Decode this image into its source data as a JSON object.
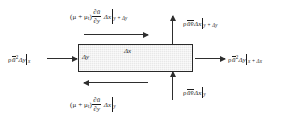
{
  "figure": {
    "colors": {
      "stroke": "#2e2e2e",
      "box_border": "#2a2a2a",
      "box_fill": "#e8e8e8",
      "text": "#1c1c1c",
      "background": "#ffffff"
    }
  },
  "control_volume": {
    "width_label": "Δx",
    "height_label": "Δy"
  },
  "fluxes": {
    "top_shear": {
      "name": "top-face-turbulent-shear-force",
      "prefactor": "(μ + μ",
      "prefactor_sub": "t",
      "prefactor_close": ")",
      "derivative_numerator": "∂ū",
      "derivative_denominator": "∂y",
      "length": "Δx",
      "evaluated_at": "y + Δy",
      "direction": "right",
      "plain": "(μ+μ_t) ∂ū/∂y Δx |_(y+Δy)"
    },
    "bottom_shear": {
      "name": "bottom-face-turbulent-shear-force",
      "prefactor": "(μ + μ",
      "prefactor_sub": "t",
      "prefactor_close": ")",
      "derivative_numerator": "∂ū",
      "derivative_denominator": "∂y",
      "length": "Δx",
      "evaluated_at": "y",
      "direction": "left",
      "plain": "(μ+μ_t) ∂ū/∂y Δx |_y"
    },
    "left_inflow": {
      "name": "left-face-x-momentum-influx",
      "density": "ρ",
      "velocity": "ū",
      "exponent": "2",
      "area": "Δy",
      "evaluated_at": "x",
      "direction": "right",
      "plain": "ρū²Δy |_x"
    },
    "right_outflow": {
      "name": "right-face-x-momentum-outflux",
      "density": "ρ",
      "velocity": "ū",
      "exponent": "2",
      "area": "Δy",
      "evaluated_at": "x + Δx",
      "direction": "right",
      "plain": "ρū²Δy |_(x+Δx)"
    },
    "top_reynolds": {
      "name": "top-face-reynolds-momentum-flux",
      "density": "ρ",
      "velocity": "ūv̄",
      "area": "Δx",
      "evaluated_at": "y + Δy",
      "direction": "up",
      "plain": "ρūv̄Δx |_(y+Δy)"
    },
    "bottom_reynolds": {
      "name": "bottom-face-reynolds-momentum-flux",
      "density": "ρ",
      "velocity": "ūv̄",
      "area": "Δx",
      "evaluated_at": "y",
      "direction": "up",
      "plain": "ρūv̄Δx |_y"
    }
  }
}
